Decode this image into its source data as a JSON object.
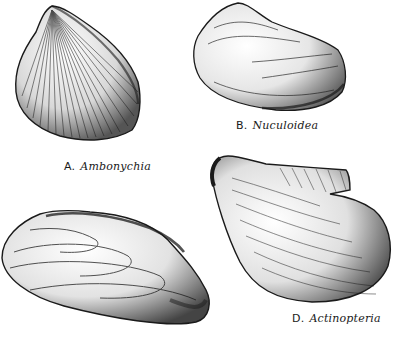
{
  "figure": {
    "panels": [
      {
        "id": "A",
        "letter": "A.",
        "genus": "Ambonychia"
      },
      {
        "id": "B",
        "letter": "B.",
        "genus": "Nuculoidea"
      },
      {
        "id": "C",
        "letter": "",
        "genus": ""
      },
      {
        "id": "D",
        "letter": "D.",
        "genus": "Actinopteria"
      }
    ]
  },
  "colors": {
    "ink": "#1a1a1a",
    "background": "#ffffff"
  }
}
